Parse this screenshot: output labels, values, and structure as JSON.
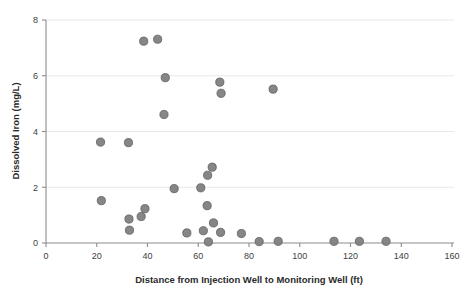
{
  "chart_data": {
    "type": "scatter",
    "title": "",
    "xlabel": "Distance from Injection Well to Monitoring Well (ft)",
    "ylabel": "Dissolved Iron (mg/L)",
    "xlim": [
      0,
      160
    ],
    "ylim": [
      0,
      8
    ],
    "xticks": [
      0,
      20,
      40,
      60,
      80,
      100,
      120,
      140,
      160
    ],
    "xtick_labels": [
      "0",
      "20",
      "40",
      "60",
      "80",
      "100",
      "120",
      "140",
      "160"
    ],
    "yticks": [
      0,
      2,
      4,
      6,
      8
    ],
    "ytick_labels": [
      "0",
      "2",
      "4",
      "6",
      "8"
    ],
    "grid": "horizontal",
    "legend": "none",
    "marker_color": "#7f7f7f",
    "marker_edge_color": "#5e5e5e",
    "axis_color": "#8c8c8c",
    "gridline_color": "#e8e8e8",
    "background_color": "#ffffff",
    "series": [
      {
        "name": "Dissolved Iron",
        "points": [
          [
            21.5,
            3.62
          ],
          [
            21.8,
            1.52
          ],
          [
            32.5,
            3.6
          ],
          [
            32.7,
            0.86
          ],
          [
            32.9,
            0.46
          ],
          [
            37.5,
            0.95
          ],
          [
            39.0,
            1.23
          ],
          [
            38.5,
            7.24
          ],
          [
            44.0,
            7.31
          ],
          [
            46.5,
            4.61
          ],
          [
            47.0,
            5.93
          ],
          [
            50.5,
            1.95
          ],
          [
            55.5,
            0.36
          ],
          [
            61.0,
            1.98
          ],
          [
            62.0,
            0.44
          ],
          [
            63.5,
            1.34
          ],
          [
            63.7,
            2.43
          ],
          [
            64.0,
            0.04
          ],
          [
            65.5,
            2.72
          ],
          [
            66.0,
            0.72
          ],
          [
            68.5,
            5.77
          ],
          [
            69.0,
            5.37
          ],
          [
            68.8,
            0.38
          ],
          [
            77.0,
            0.34
          ],
          [
            84.0,
            0.05
          ],
          [
            89.5,
            5.52
          ],
          [
            91.5,
            0.06
          ],
          [
            113.5,
            0.06
          ],
          [
            123.5,
            0.06
          ],
          [
            134.0,
            0.06
          ]
        ]
      }
    ]
  },
  "axes": {
    "x_title": "Distance from Injection Well to Monitoring Well (ft)",
    "y_title": "Dissolved Iron (mg/L)"
  }
}
